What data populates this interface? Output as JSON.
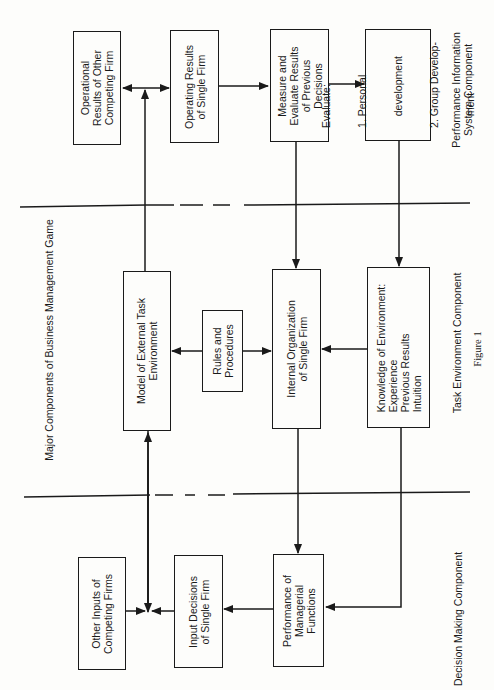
{
  "title": "Major Components of Business Management Game",
  "figure_label": "Figure 1",
  "components": {
    "performance": [
      "Performance Information",
      "System Component"
    ],
    "task": "Task Environment Component",
    "decision": "Decision Making Component"
  },
  "boxes": {
    "operational_results_other": [
      "Operational",
      "Results of Other",
      "Competing Firm"
    ],
    "operating_results_single": [
      "Operating Results",
      "of Single Firm"
    ],
    "measure_evaluate": [
      "Measure and",
      "Evaluate Results",
      "of Previous",
      "Decisions"
    ],
    "evaluate": [
      "Evaluate:",
      "1. Personal",
      "    development",
      "2. Group Develop-",
      "    ment"
    ],
    "model_external": [
      "Model of External Task",
      "Environment"
    ],
    "rules_procedures": [
      "Rules and",
      "Procedures"
    ],
    "internal_org": [
      "Internal Organization",
      "of Single Firm"
    ],
    "knowledge_env": [
      "Knowledge of Environment:",
      "Experience",
      "Previous Results",
      "Intuition"
    ],
    "other_inputs": [
      "Other Inputs of",
      "Competing Firms"
    ],
    "input_decisions": [
      "Input Decisions",
      "of Single Firm"
    ],
    "performance_managerial": [
      "Performance of",
      "Managerial",
      "Functions"
    ]
  },
  "colors": {
    "ink": "#1a1a1a",
    "paper": "#fdfdfb"
  }
}
